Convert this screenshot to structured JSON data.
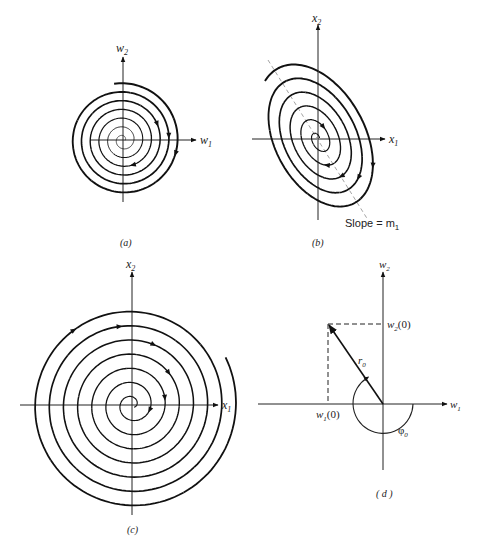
{
  "figure": {
    "panels": [
      {
        "id": "a",
        "caption": "(a)",
        "x_axis": "w",
        "x_axis_sub": "1",
        "y_axis": "w",
        "y_axis_sub": "2",
        "description": "Circular spiral converging to origin in w-coordinates"
      },
      {
        "id": "b",
        "caption": "(b)",
        "x_axis": "x",
        "x_axis_sub": "1",
        "y_axis": "x",
        "y_axis_sub": "2",
        "slope_label": "Slope = m",
        "slope_label_sub": "1",
        "description": "Elliptical spiral tilted along line of slope m1"
      },
      {
        "id": "c",
        "caption": "(c)",
        "x_axis": "x",
        "x_axis_sub": "1",
        "y_axis": "x",
        "y_axis_sub": "2",
        "description": "Spiral diverging outward from origin"
      },
      {
        "id": "d",
        "caption": "( d )",
        "x_axis": "w",
        "x_axis_sub": "1",
        "y_axis": "w",
        "y_axis_sub": "2",
        "w1_label": "w",
        "w1_label_sub": "1",
        "w1_label_arg": "(0)",
        "w2_label": "w",
        "w2_label_sub": "2",
        "w2_label_arg": "(0)",
        "r_label": "r",
        "r_label_sub": "0",
        "phi_label": "φ",
        "phi_label_sub": "0",
        "description": "Initial vector with magnitude r0 and angle phi0"
      }
    ]
  }
}
